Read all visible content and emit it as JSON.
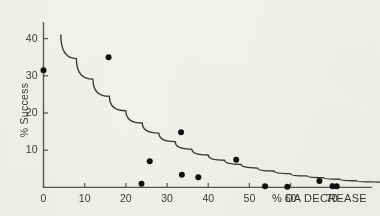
{
  "chart_data": {
    "type": "scatter",
    "title": "",
    "xlabel": "% DA DECREASE",
    "ylabel": "% Success",
    "xlim": [
      0,
      82
    ],
    "ylim": [
      0,
      44
    ],
    "grid": false,
    "legend": null,
    "x_ticks": [
      0,
      10,
      20,
      30,
      40,
      50,
      60,
      70
    ],
    "x_tick_labels": [
      "0",
      "10",
      "20",
      "30",
      "40",
      "50",
      "60",
      "70"
    ],
    "y_ticks": [
      10,
      20,
      30,
      40
    ],
    "y_tick_labels": [
      "10",
      "20",
      "30",
      "40"
    ],
    "x_axis_unit_label": "% DA DECREASE",
    "marker": "filled-circle",
    "marker_color": "#111111",
    "axis_color": "#55544f",
    "curve_color": "#3a3936",
    "background_color": "#f2f1ee",
    "points": [
      {
        "x": 0.0,
        "y": 31.5
      },
      {
        "x": 15.8,
        "y": 35.0
      },
      {
        "x": 23.8,
        "y": 1.0
      },
      {
        "x": 25.8,
        "y": 7.0
      },
      {
        "x": 33.4,
        "y": 14.8
      },
      {
        "x": 33.6,
        "y": 3.4
      },
      {
        "x": 37.6,
        "y": 2.7
      },
      {
        "x": 46.8,
        "y": 7.4
      },
      {
        "x": 53.8,
        "y": 0.3
      },
      {
        "x": 59.2,
        "y": 0.2
      },
      {
        "x": 67.0,
        "y": 1.7
      },
      {
        "x": 70.2,
        "y": 0.3
      },
      {
        "x": 71.2,
        "y": 0.3
      }
    ],
    "fit_curve": {
      "description": "monotonic decaying exponential fit",
      "points": [
        {
          "x": 4.2,
          "y": 41.0
        },
        {
          "x": 8.0,
          "y": 34.6
        },
        {
          "x": 12.0,
          "y": 29.1
        },
        {
          "x": 16.0,
          "y": 24.5
        },
        {
          "x": 20.0,
          "y": 20.6
        },
        {
          "x": 24.0,
          "y": 17.3
        },
        {
          "x": 28.0,
          "y": 14.6
        },
        {
          "x": 32.0,
          "y": 12.3
        },
        {
          "x": 36.0,
          "y": 10.3
        },
        {
          "x": 40.0,
          "y": 8.7
        },
        {
          "x": 44.0,
          "y": 7.3
        },
        {
          "x": 48.0,
          "y": 6.2
        },
        {
          "x": 52.0,
          "y": 5.2
        },
        {
          "x": 56.0,
          "y": 4.4
        },
        {
          "x": 60.0,
          "y": 3.7
        },
        {
          "x": 64.0,
          "y": 3.1
        },
        {
          "x": 68.0,
          "y": 2.6
        },
        {
          "x": 72.0,
          "y": 2.2
        },
        {
          "x": 76.0,
          "y": 1.8
        },
        {
          "x": 80.0,
          "y": 1.5
        },
        {
          "x": 82.0,
          "y": 1.4
        }
      ]
    }
  }
}
